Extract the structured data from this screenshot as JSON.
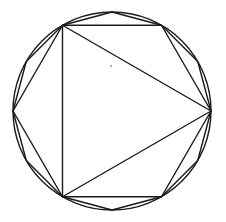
{
  "diagram": {
    "type": "inscribed-polygons",
    "canvas": {
      "width": 226,
      "height": 222,
      "background": "#ffffff"
    },
    "stroke_color": "#1a1a1a",
    "circle": {
      "cx": 112,
      "cy": 111,
      "r": 99
    },
    "polygons": [
      {
        "name": "triangle",
        "sides": 3,
        "start_angle_deg": 0
      },
      {
        "name": "hexagon",
        "sides": 6,
        "start_angle_deg": 0
      },
      {
        "name": "dodecagon",
        "sides": 12,
        "start_angle_deg": 0
      }
    ],
    "marker": {
      "cx": 111,
      "cy": 66,
      "r": 1.3,
      "color": "#b8b8b8"
    }
  }
}
